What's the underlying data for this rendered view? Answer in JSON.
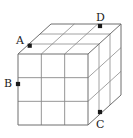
{
  "figure": {
    "type": "geometry-diagram",
    "background_color": "#ffffff",
    "line_color": "#7a7a7a",
    "outline_color": "#666666",
    "marker_color": "#1a1a1a",
    "label_color": "#1a1a1a"
  },
  "cube": {
    "divisions": 3,
    "projection": "oblique",
    "front_face": {
      "left": 18,
      "top": 54,
      "right": 88,
      "bottom": 125
    },
    "depth_offset": {
      "dx": 33,
      "dy": -30
    }
  },
  "labels": {
    "a": "A",
    "b": "B",
    "c": "C",
    "d": "D"
  },
  "markers": {
    "a": {
      "x": 30,
      "y": 46
    },
    "b": {
      "x": 18,
      "y": 84
    },
    "c": {
      "x": 100,
      "y": 112
    },
    "d": {
      "x": 100,
      "y": 26
    }
  },
  "label_positions": {
    "a": {
      "x": 16,
      "y": 35
    },
    "b": {
      "x": 4,
      "y": 78
    },
    "c": {
      "x": 96,
      "y": 119
    },
    "d": {
      "x": 96,
      "y": 12
    }
  }
}
